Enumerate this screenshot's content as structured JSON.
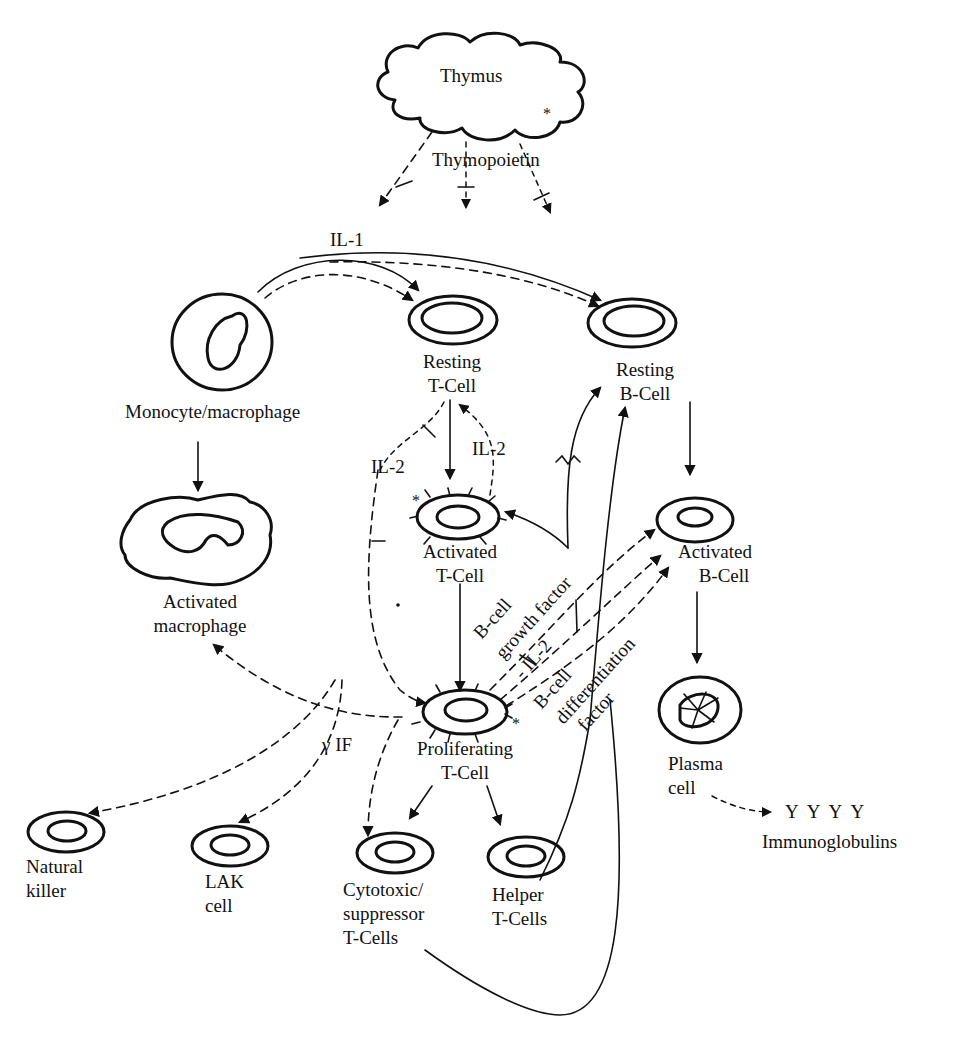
{
  "diagram": {
    "type": "immune-cell-interaction-flow",
    "colors": {
      "ink": "#111111",
      "background": "#ffffff"
    },
    "nodes": {
      "thymus": {
        "label": "Thymus",
        "marker": "*"
      },
      "monocyte": {
        "label": "Monocyte/macrophage"
      },
      "activated_macrophage": {
        "line1": "Activated",
        "line2": "macrophage"
      },
      "resting_t": {
        "line1": "Resting",
        "line2": "T-Cell"
      },
      "resting_b": {
        "line1": "Resting",
        "line2": "B-Cell"
      },
      "activated_t": {
        "line1": "Activated",
        "line2": "T-Cell",
        "marker": "*"
      },
      "activated_b": {
        "line1": "Activated",
        "line2": "B-Cell"
      },
      "proliferating_t": {
        "line1": "Proliferating",
        "line2": "T-Cell",
        "marker": "*"
      },
      "plasma": {
        "line1": "Plasma",
        "line2": "cell"
      },
      "natural_killer": {
        "line1": "Natural",
        "line2": "killer"
      },
      "lak": {
        "line1": "LAK",
        "line2": "cell"
      },
      "cytotoxic": {
        "line1": "Cytotoxic/",
        "line2": "suppressor",
        "line3": "T-Cells"
      },
      "helper": {
        "line1": "Helper",
        "line2": "T-Cells"
      },
      "immunoglobulins": {
        "symbols": "Y  Y  Y  Y",
        "label": "Immunoglobulins"
      }
    },
    "signals": {
      "thymopoietin": "Thymopoietin",
      "il1": "IL-1",
      "il2_left": "IL-2",
      "il2_right": "IL-2",
      "gamma_if": "γ IF",
      "b_cell_growth_factor_1": "B-cell",
      "b_cell_growth_factor_2": "growth factor",
      "il2_diag": "- IL-2",
      "b_cell_diff_1": "B-cell",
      "b_cell_diff_2": "differentiation",
      "b_cell_diff_3": "factor"
    },
    "edges": [
      {
        "from": "thymus",
        "to": "targets",
        "style": "dashed",
        "label": "Thymopoietin"
      },
      {
        "from": "monocyte",
        "to": "resting_t",
        "style": "solid+dashed",
        "label": "IL-1"
      },
      {
        "from": "monocyte",
        "to": "resting_b",
        "style": "solid+dashed",
        "label": "IL-1"
      },
      {
        "from": "monocyte",
        "to": "activated_macrophage",
        "style": "solid"
      },
      {
        "from": "resting_t",
        "to": "activated_t",
        "style": "solid"
      },
      {
        "from": "activated_t",
        "to": "resting_t",
        "style": "dashed",
        "label": "IL-2"
      },
      {
        "from": "resting_t",
        "to": "proliferating_t",
        "style": "dashed",
        "label": "IL-2"
      },
      {
        "from": "activated_t",
        "to": "proliferating_t",
        "style": "solid"
      },
      {
        "from": "proliferating_t",
        "to": "activated_b",
        "style": "dashed",
        "label": "B-cell growth factor"
      },
      {
        "from": "proliferating_t",
        "to": "activated_b",
        "style": "dashed",
        "label": "IL-2"
      },
      {
        "from": "proliferating_t",
        "to": "activated_b",
        "style": "dashed",
        "label": "B-cell differentiation factor"
      },
      {
        "from": "proliferating_t",
        "to": "activated_macrophage",
        "style": "dashed",
        "label": "γ IF"
      },
      {
        "from": "proliferating_t",
        "to": "natural_killer",
        "style": "dashed"
      },
      {
        "from": "proliferating_t",
        "to": "lak",
        "style": "dashed"
      },
      {
        "from": "proliferating_t",
        "to": "cytotoxic",
        "style": "dashed"
      },
      {
        "from": "proliferating_t",
        "to": "cytotoxic",
        "style": "solid"
      },
      {
        "from": "proliferating_t",
        "to": "helper",
        "style": "solid"
      },
      {
        "from": "helper",
        "to": "resting_b",
        "style": "solid"
      },
      {
        "from": "cytotoxic",
        "to": "resting_b",
        "style": "solid"
      },
      {
        "from": "helper",
        "to": "activated_t",
        "style": "solid"
      },
      {
        "from": "resting_b",
        "to": "activated_b",
        "style": "solid"
      },
      {
        "from": "activated_b",
        "to": "plasma",
        "style": "solid"
      },
      {
        "from": "plasma",
        "to": "immunoglobulins",
        "style": "dashed"
      }
    ]
  }
}
